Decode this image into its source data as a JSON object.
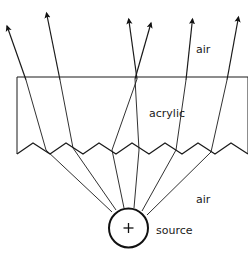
{
  "figure": {
    "type": "optical-ray-diagram",
    "background_color": "#ffffff",
    "line_color": "#1a1a1a"
  },
  "labels": {
    "air_top": "air",
    "acrylic": "acrylic",
    "air_bottom": "air",
    "source": "source"
  },
  "label_positions": {
    "air_top": {
      "x": 196,
      "y": 50
    },
    "acrylic": {
      "x": 149,
      "y": 114
    },
    "air_bottom": {
      "x": 196,
      "y": 200
    },
    "source": {
      "x": 156,
      "y": 231
    }
  },
  "source_marker": {
    "cx": 128.5,
    "cy": 228,
    "r": 19.5,
    "stroke_width": 2,
    "cross_size": 5
  },
  "slab": {
    "left_x": 17,
    "right_x": 248,
    "top_y": 77,
    "sawtooth_valley_y": 154,
    "sawtooth_peak_y": 143,
    "tooth_count": 7
  },
  "sawtooth_points": [
    {
      "x": 17,
      "y": 154
    },
    {
      "x": 33,
      "y": 143
    },
    {
      "x": 50,
      "y": 154
    },
    {
      "x": 66,
      "y": 143
    },
    {
      "x": 83,
      "y": 154
    },
    {
      "x": 99,
      "y": 143
    },
    {
      "x": 116,
      "y": 154
    },
    {
      "x": 132,
      "y": 143
    },
    {
      "x": 149,
      "y": 154
    },
    {
      "x": 165,
      "y": 143
    },
    {
      "x": 182,
      "y": 154
    },
    {
      "x": 198,
      "y": 143
    },
    {
      "x": 215,
      "y": 154
    },
    {
      "x": 231,
      "y": 143
    },
    {
      "x": 248,
      "y": 154
    }
  ],
  "rays": [
    {
      "name": "ray-1",
      "source_exit": {
        "x": 112,
        "y": 212
      },
      "facet_hit": {
        "x": 46,
        "y": 150
      },
      "slab_exit": {
        "x": 26,
        "y": 80
      },
      "arrow_tip": {
        "x": 5,
        "y": 24
      }
    },
    {
      "name": "ray-2",
      "source_exit": {
        "x": 116,
        "y": 210
      },
      "facet_hit": {
        "x": 73,
        "y": 148
      },
      "slab_exit": {
        "x": 60,
        "y": 80
      },
      "arrow_tip": {
        "x": 45,
        "y": 10
      }
    },
    {
      "name": "ray-3",
      "source_exit": {
        "x": 124,
        "y": 208
      },
      "facet_hit": {
        "x": 112,
        "y": 150
      },
      "slab_exit": {
        "x": 137,
        "y": 79
      },
      "arrow_tip": {
        "x": 128,
        "y": 16
      }
    },
    {
      "name": "ray-4",
      "source_exit": {
        "x": 134,
        "y": 208
      },
      "facet_hit": {
        "x": 139,
        "y": 150
      },
      "slab_exit": {
        "x": 135,
        "y": 79
      },
      "arrow_tip": {
        "x": 152,
        "y": 20
      }
    },
    {
      "name": "ray-5",
      "source_exit": {
        "x": 142,
        "y": 211
      },
      "facet_hit": {
        "x": 176,
        "y": 150
      },
      "slab_exit": {
        "x": 186,
        "y": 80
      },
      "arrow_tip": {
        "x": 193,
        "y": 16
      }
    },
    {
      "name": "ray-6",
      "source_exit": {
        "x": 147,
        "y": 215
      },
      "facet_hit": {
        "x": 211,
        "y": 152
      },
      "slab_exit": {
        "x": 227,
        "y": 80
      },
      "arrow_tip": {
        "x": 239,
        "y": 14
      }
    }
  ]
}
